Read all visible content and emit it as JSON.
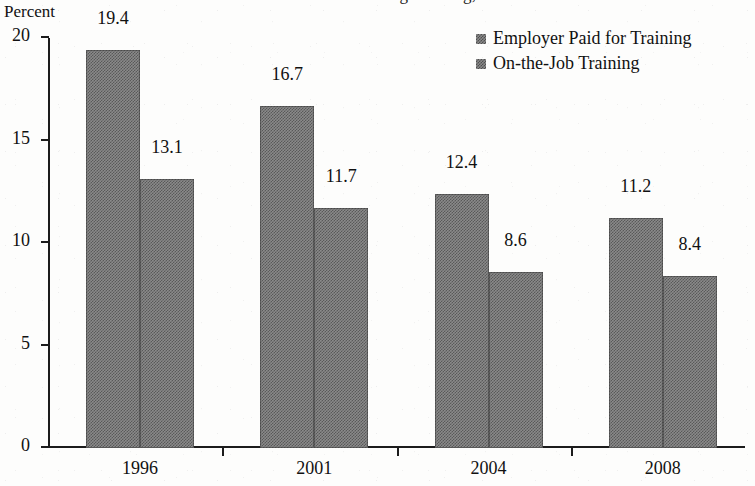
{
  "axis_title": "Percent",
  "title_fragment": "Percent of Workers Receiving Training, 1996-2008",
  "legend": {
    "items": [
      {
        "label": "Employer Paid for Training",
        "swatch": "gray-dither-swatch"
      },
      {
        "label": "On-the-Job Training",
        "swatch": "gray-dither-swatch"
      }
    ]
  },
  "chart_data": {
    "type": "bar",
    "title": "",
    "xlabel": "",
    "ylabel": "Percent",
    "ylim": [
      0,
      20
    ],
    "yticks": [
      0,
      5,
      10,
      15,
      20
    ],
    "ytick_labels": [
      "0",
      "5",
      "10",
      "15",
      "20"
    ],
    "grid": false,
    "legend_position": "top-right",
    "categories": [
      "1996",
      "2001",
      "2004",
      "2008"
    ],
    "series": [
      {
        "name": "Employer Paid for Training",
        "values": [
          19.4,
          16.7,
          12.4,
          11.2
        ],
        "labels": [
          "19.4",
          "16.7",
          "12.4",
          "11.2"
        ],
        "color": "#8a8a8a"
      },
      {
        "name": "On-the-Job Training",
        "values": [
          13.1,
          11.7,
          8.6,
          8.4
        ],
        "labels": [
          "13.1",
          "11.7",
          "8.6",
          "8.4"
        ],
        "color": "#8a8a8a"
      }
    ]
  }
}
